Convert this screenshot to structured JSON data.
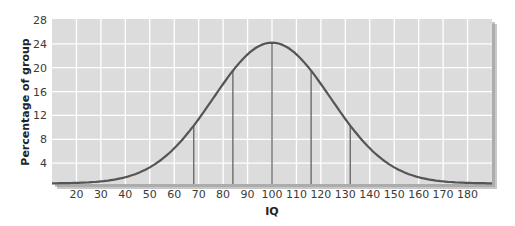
{
  "chart_data": {
    "type": "line",
    "title": "",
    "xlabel": "IQ",
    "ylabel": "Percentage of group",
    "xlim": [
      10,
      190
    ],
    "ylim": [
      0,
      28
    ],
    "x_ticks": [
      20,
      30,
      40,
      50,
      60,
      70,
      80,
      90,
      100,
      110,
      120,
      130,
      140,
      150,
      160,
      170,
      180
    ],
    "y_ticks": [
      4,
      8,
      12,
      16,
      20,
      24,
      28
    ],
    "grid": true,
    "legend": null,
    "series": [
      {
        "name": "IQ distribution",
        "curve": "normal",
        "mean": 100,
        "peak": 24.2,
        "x": [
          10,
          20,
          30,
          40,
          50,
          60,
          68,
          70,
          80,
          84,
          90,
          100,
          110,
          116,
          120,
          130,
          132,
          140,
          150,
          160,
          170,
          180,
          190
        ],
        "y": [
          0.6,
          0.9,
          1.6,
          2.8,
          4.6,
          7.4,
          10.3,
          11.0,
          16.0,
          19.5,
          22.5,
          24.2,
          22.5,
          19.5,
          16.0,
          11.0,
          10.3,
          7.4,
          4.6,
          2.8,
          1.6,
          0.9,
          0.6
        ]
      }
    ],
    "vertical_markers": [
      68,
      84,
      100,
      116,
      132
    ],
    "colors": {
      "plot_background": "#dcdcdc",
      "gridline": "#ffffff",
      "curve": "#555555",
      "marker_line": "#5a5a5a",
      "shadow": "#9a9a9a"
    }
  }
}
